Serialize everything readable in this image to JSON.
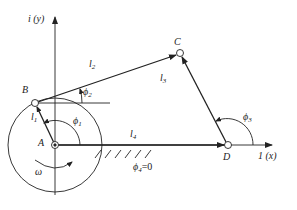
{
  "diagram": {
    "points": {
      "A": {
        "label": "A",
        "x": 55,
        "y": 145
      },
      "B": {
        "label": "B",
        "x": 35,
        "y": 103
      },
      "C": {
        "label": "C",
        "x": 180,
        "y": 53
      },
      "D": {
        "label": "D",
        "x": 228,
        "y": 145
      }
    },
    "axes": {
      "x_label": "1 (x)",
      "y_label": "i (y)"
    },
    "links": [
      {
        "name": "l1",
        "label": "l",
        "sub": "1"
      },
      {
        "name": "l2",
        "label": "l",
        "sub": "2"
      },
      {
        "name": "l3",
        "label": "l",
        "sub": "3"
      },
      {
        "name": "l4",
        "label": "l",
        "sub": "4"
      }
    ],
    "angles": [
      {
        "name": "phi1",
        "label": "ϕ",
        "sub": "1"
      },
      {
        "name": "phi2",
        "label": "ϕ",
        "sub": "2"
      },
      {
        "name": "phi3",
        "label": "ϕ",
        "sub": "3"
      }
    ],
    "phi4_label": "ϕ",
    "phi4_sub": "4",
    "phi4_value": "=0",
    "omega_label": "ω",
    "colors": {
      "line": "#222222",
      "background": "#ffffff"
    }
  }
}
